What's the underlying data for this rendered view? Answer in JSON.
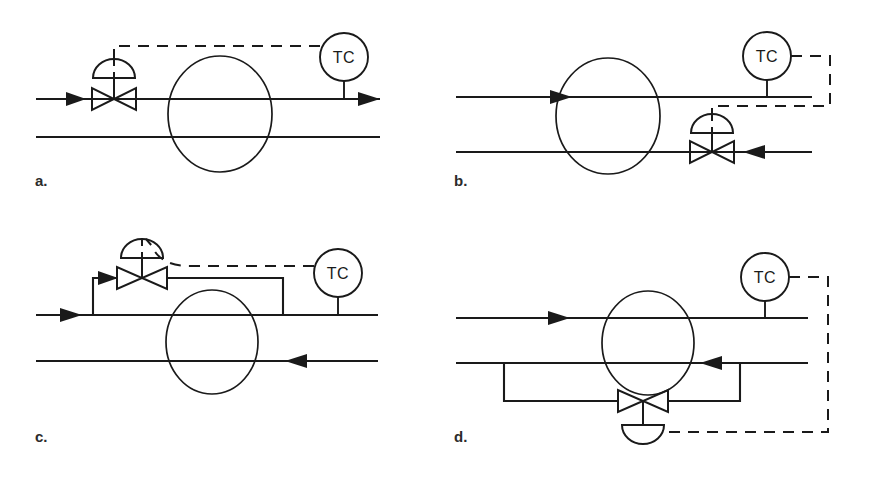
{
  "figure": {
    "background_color": "#ffffff",
    "line_color": "#1a1a1a",
    "width": 871,
    "height": 480
  },
  "legend": {
    "instrument_tag": "TC",
    "instrument_description": "temperature controller",
    "signal_line_style": "dashed",
    "process_line_style": "solid"
  },
  "panels": [
    {
      "id": "a",
      "label": "a.",
      "instrument": "TC",
      "valve": {
        "type": "control-valve",
        "actuator": "diaphragm-dome",
        "actuator_orientation": "up",
        "location": "inlet of top process line",
        "has_bypass": false
      },
      "top_line": {
        "flow_direction": "left-to-right",
        "arrows": [
          "inlet",
          "outlet"
        ]
      },
      "bottom_line": {
        "flow_direction": "none",
        "arrows": []
      },
      "signal_path": "from TC up and left to valve actuator"
    },
    {
      "id": "b",
      "label": "b.",
      "instrument": "TC",
      "valve": {
        "type": "control-valve",
        "actuator": "diaphragm-dome",
        "actuator_orientation": "up",
        "location": "bottom process line, right of vessel",
        "has_bypass": false
      },
      "top_line": {
        "flow_direction": "left-to-right",
        "arrows": [
          "mid"
        ]
      },
      "bottom_line": {
        "flow_direction": "right-to-left",
        "arrows": [
          "inlet-right"
        ]
      },
      "signal_path": "from TC right, down, then left to valve actuator"
    },
    {
      "id": "c",
      "label": "c.",
      "instrument": "TC",
      "valve": {
        "type": "control-valve",
        "actuator": "diaphragm-dome",
        "actuator_orientation": "up",
        "location": "bypass loop above top process line",
        "has_bypass": true
      },
      "top_line": {
        "flow_direction": "left-to-right",
        "arrows": [
          "inlet",
          "bypass-branch"
        ]
      },
      "bottom_line": {
        "flow_direction": "right-to-left",
        "arrows": [
          "mid-right"
        ]
      },
      "signal_path": "from TC left and up over to valve actuator"
    },
    {
      "id": "d",
      "label": "d.",
      "instrument": "TC",
      "valve": {
        "type": "control-valve",
        "actuator": "diaphragm-dome",
        "actuator_orientation": "down",
        "location": "bypass loop below bottom process line",
        "has_bypass": true
      },
      "top_line": {
        "flow_direction": "left-to-right",
        "arrows": [
          "mid-left"
        ]
      },
      "bottom_line": {
        "flow_direction": "right-to-left",
        "arrows": [
          "mid-right"
        ]
      },
      "signal_path": "from TC right, down, then left to valve actuator"
    }
  ]
}
